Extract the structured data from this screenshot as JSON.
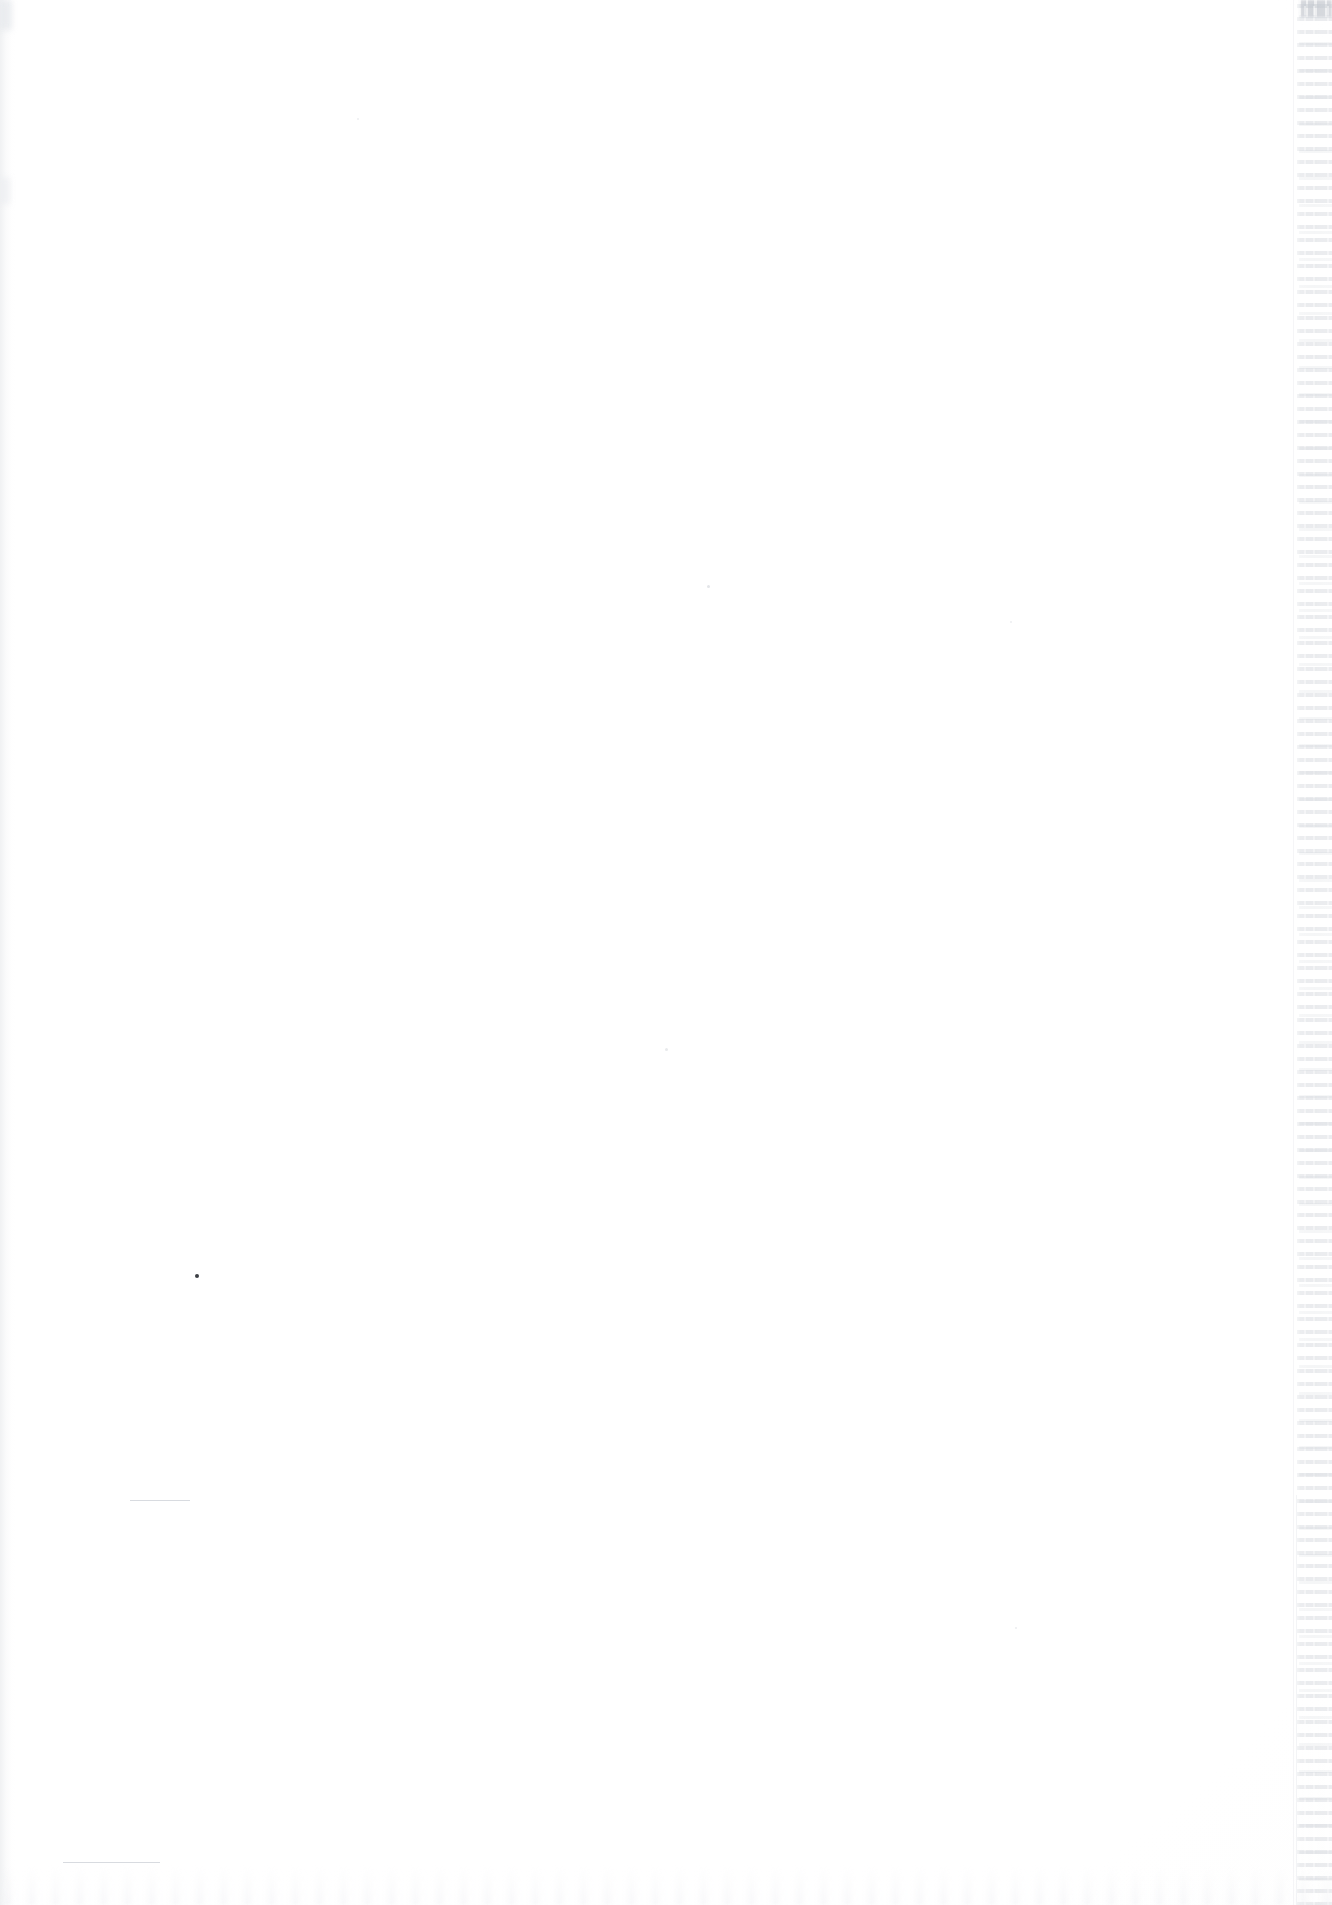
{
  "document": {
    "page_type": "blank-verso",
    "visible_text": "",
    "page_number": "",
    "header_text": "",
    "footer_text": "",
    "caption": "",
    "note": ""
  },
  "canvas": {
    "width": 1332,
    "height": 1905,
    "paper_color": "#ffffff"
  },
  "artifacts": {
    "left_scan_shadow": {
      "label": "",
      "color": "#e4e6e9"
    },
    "bottom_scan_noise": {
      "label": "",
      "color": "#f0f1f4"
    },
    "showthrough_strip": {
      "label": "",
      "description": "",
      "rule_color": "#d0d4da",
      "text_ghost_color": "#bac0c8",
      "corner_block_color": "#c4c8cf",
      "left": 1290,
      "width": 42,
      "top": 0,
      "height": 1905
    },
    "faint_rules": [
      {
        "left": 130,
        "top": 1500,
        "width": 60,
        "height": 1
      },
      {
        "left": 63,
        "top": 1862,
        "width": 97,
        "height": 1
      }
    ],
    "specks": [
      {
        "left": 195,
        "top": 1274,
        "size": 4,
        "color": "#3c3f44"
      },
      {
        "left": 707,
        "top": 585,
        "size": 3,
        "color": "#e3e5e8"
      },
      {
        "left": 665,
        "top": 1048,
        "size": 3,
        "color": "#e8eaec"
      },
      {
        "left": 357,
        "top": 118,
        "size": 2,
        "color": "#eceef0"
      },
      {
        "left": 1010,
        "top": 621,
        "size": 2,
        "color": "#eceef0"
      },
      {
        "left": 1015,
        "top": 1627,
        "size": 2,
        "color": "#ebedef"
      }
    ]
  }
}
